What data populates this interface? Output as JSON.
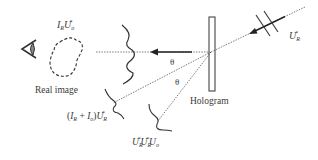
{
  "figure": {
    "labels": {
      "top_object": {
        "main": "I",
        "sub1": "R",
        "main2": "U",
        "sub2": "o",
        "sup2": "*"
      },
      "real_image": "Real image",
      "hologram": "Hologram",
      "theta_1": "θ",
      "theta_2": "θ",
      "reference_beam": {
        "main": "U",
        "sub": "R",
        "sup": "*"
      },
      "zero_order": {
        "open": "(",
        "a": "I",
        "a_sub": "R",
        "plus": " + ",
        "b": "I",
        "b_sub": "o",
        "close": ")",
        "u": "U",
        "u_sub": "R",
        "u_sup": "*"
      },
      "twin_image": {
        "u1": "U",
        "u1_sub": "R",
        "u1_sup": "*",
        "u2": "U",
        "u2_sub": "R",
        "u2_sup": "*",
        "u3": "U",
        "u3_sub": "o"
      }
    },
    "elements": {
      "eye": "eye-icon",
      "object": "dashed-real-image-outline",
      "plate": "hologram-plate",
      "wavefronts": [
        "real-image-wavefront",
        "zero-order-wavefront",
        "twin-image-wavefront",
        "reference-wavefront"
      ]
    },
    "colors": {
      "line": "#333333",
      "text": "#3a3a3a",
      "eye_fill": "#8a8a8a"
    }
  }
}
